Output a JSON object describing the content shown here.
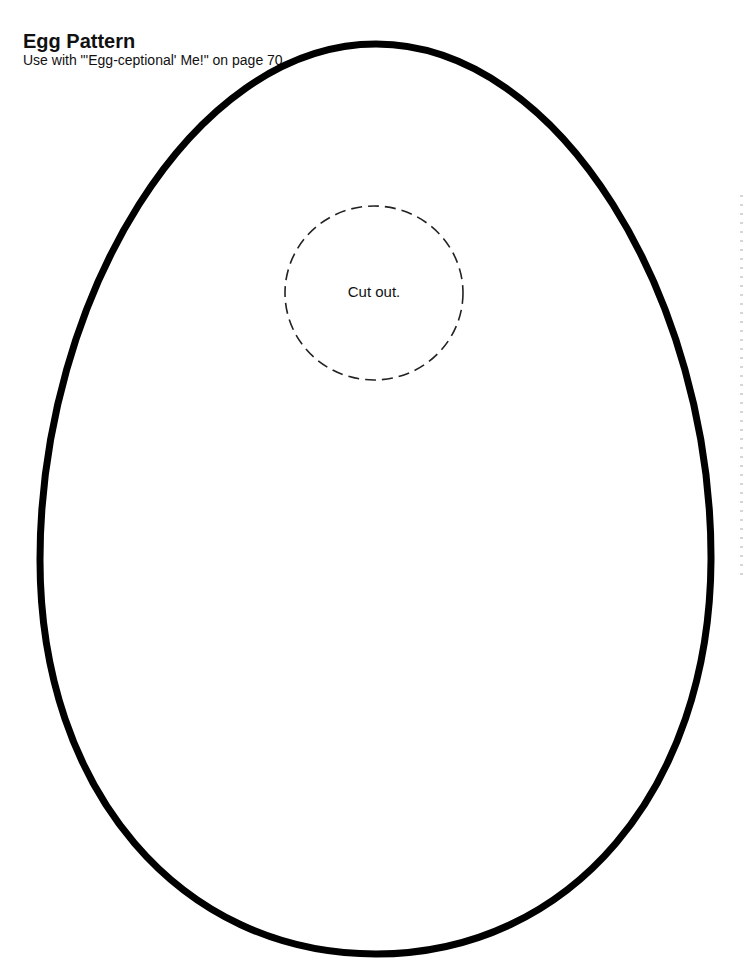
{
  "header": {
    "title": "Egg Pattern",
    "subtitle": "Use with \"'Egg-ceptional' Me!\" on page 70."
  },
  "pattern": {
    "shape": "egg-outline",
    "cutout": {
      "label": "Cut out.",
      "shape": "dashed-circle"
    }
  },
  "colors": {
    "outline": "#000000",
    "background": "#ffffff",
    "text": "#111111"
  }
}
